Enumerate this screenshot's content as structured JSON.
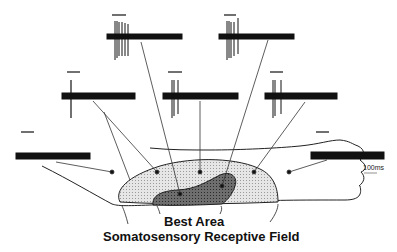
{
  "figure": {
    "labels": {
      "best_area": "Best Area",
      "receptive_field": "Somatosensory Receptive Field",
      "scale_bar": "100ms"
    },
    "colors": {
      "ink": "#111111",
      "receptive_field_fill": "#d8d8d8",
      "best_area_fill": "#7a7a7a",
      "background": "#ffffff"
    },
    "traces": [
      {
        "id": "top-left",
        "x": 107,
        "y": 36,
        "response": "strong"
      },
      {
        "id": "top-right",
        "x": 219,
        "y": 36,
        "response": "strong"
      },
      {
        "id": "mid-left",
        "x": 62,
        "y": 96,
        "response": "weak"
      },
      {
        "id": "mid-center",
        "x": 163,
        "y": 96,
        "response": "moderate"
      },
      {
        "id": "mid-right",
        "x": 265,
        "y": 96,
        "response": "moderate"
      },
      {
        "id": "far-left",
        "x": 16,
        "y": 156,
        "response": "none"
      },
      {
        "id": "far-right",
        "x": 311,
        "y": 156,
        "response": "none"
      }
    ]
  }
}
